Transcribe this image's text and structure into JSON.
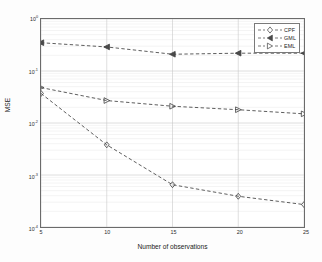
{
  "chart_data": {
    "type": "line",
    "title": "",
    "xlabel": "Number of observations",
    "ylabel": "MSE",
    "x": [
      5,
      10,
      15,
      20,
      25
    ],
    "xlim": [
      5,
      25
    ],
    "xticks": [
      5,
      10,
      15,
      20,
      25
    ],
    "xtick_labels": [
      "5",
      "10",
      "15",
      "20",
      "25"
    ],
    "yscale": "log",
    "ylim": [
      0.0001,
      1
    ],
    "yticks": [
      1,
      0.1,
      0.01,
      0.001,
      0.0001
    ],
    "ytick_labels": [
      "10",
      "10",
      "10",
      "10",
      "10"
    ],
    "ytick_exponents": [
      "0",
      "-1",
      "-2",
      "-3",
      "-4"
    ],
    "grid": true,
    "minor_grid": true,
    "legend_position": "top-right",
    "series": [
      {
        "name": "CPF",
        "marker": "diamond",
        "linestyle": "dashed",
        "color": "#3f3f3f",
        "values": [
          0.037,
          0.0038,
          0.00065,
          0.00039,
          0.00027
        ]
      },
      {
        "name": "GML",
        "marker": "triangle-left",
        "linestyle": "dashed",
        "color": "#3f3f3f",
        "values": [
          0.35,
          0.29,
          0.21,
          0.22,
          0.22
        ]
      },
      {
        "name": "EML",
        "marker": "triangle-right",
        "linestyle": "dashed",
        "color": "#3f3f3f",
        "values": [
          0.048,
          0.027,
          0.021,
          0.018,
          0.015
        ]
      }
    ]
  },
  "legend": {
    "entries": [
      {
        "label": "CPF",
        "marker": "diamond-icon"
      },
      {
        "label": "GML",
        "marker": "triangle-left-icon"
      },
      {
        "label": "EML",
        "marker": "triangle-right-icon"
      }
    ]
  },
  "axes": {
    "xlabel": "Number of observations",
    "ylabel": "MSE"
  }
}
